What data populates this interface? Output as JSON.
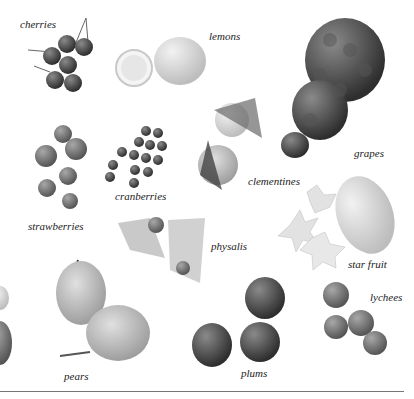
{
  "page": {
    "style": "grayscale illustrated fruit reference page",
    "colors": {
      "background": "#ffffff",
      "label_text": "#222222",
      "rule": "#777777"
    }
  },
  "fruits": [
    {
      "id": "cherries",
      "label": "cherries"
    },
    {
      "id": "lemons",
      "label": "lemons"
    },
    {
      "id": "grapes",
      "label": "grapes"
    },
    {
      "id": "clementines",
      "label": "clementines"
    },
    {
      "id": "cranberries",
      "label": "cranberries"
    },
    {
      "id": "strawberries",
      "label": "strawberries"
    },
    {
      "id": "physalis",
      "label": "physalis"
    },
    {
      "id": "star_fruit",
      "label": "star fruit"
    },
    {
      "id": "lychees",
      "label": "lychees"
    },
    {
      "id": "pears",
      "label": "pears"
    },
    {
      "id": "plums",
      "label": "plums"
    }
  ]
}
